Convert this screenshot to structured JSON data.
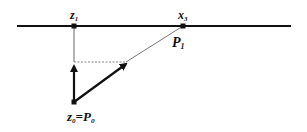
{
  "diagram": {
    "colors": {
      "ink": "#111111",
      "background": "#ffffff"
    },
    "labels": {
      "z1": {
        "base": "z",
        "sub": "1"
      },
      "x3": {
        "base": "x",
        "sub": "3"
      },
      "p1": {
        "base": "P",
        "sub": "1"
      },
      "z0": {
        "base": "z",
        "sub": "0",
        "eq": "=",
        "base2": "P",
        "sub2": "0"
      }
    },
    "points": {
      "z1": [
        74,
        26
      ],
      "x3": [
        183,
        26
      ],
      "z0": [
        74,
        102
      ],
      "corner": [
        74,
        62
      ],
      "arrow_tip": [
        128,
        62
      ]
    },
    "axis": {
      "x_start": 17,
      "x_end": 291,
      "y": 26
    }
  }
}
